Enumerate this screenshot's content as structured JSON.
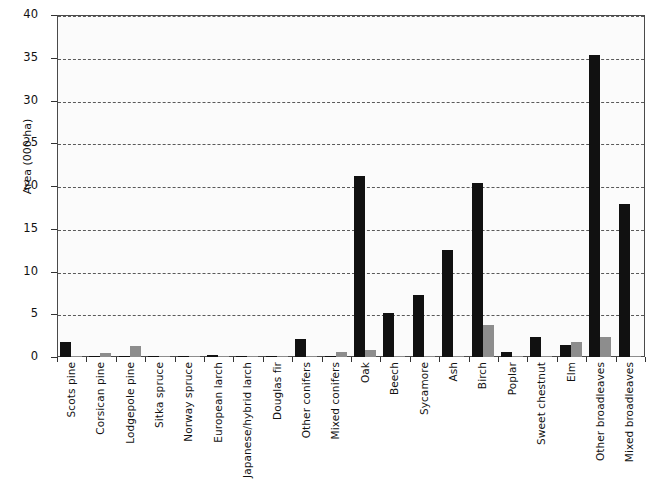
{
  "chart_data": {
    "type": "bar",
    "title": "",
    "xlabel": "",
    "ylabel": "Area (000 ha)",
    "ylim": [
      0,
      40
    ],
    "yticks": [
      0,
      5,
      10,
      15,
      20,
      25,
      30,
      35,
      40
    ],
    "grid": true,
    "legend": "none",
    "categories": [
      "Scots pine",
      "Corsican pine",
      "Lodgepole pine",
      "Sitka spruce",
      "Norway spruce",
      "European larch",
      "Japanese/hybrid larch",
      "Douglas fir",
      "Other conifers",
      "Mixed conifers",
      "Oak",
      "Beech",
      "Sycamore",
      "Ash",
      "Birch",
      "Poplar",
      "Sweet chestnut",
      "Elm",
      "Other broadleaves",
      "Mixed broadleaves"
    ],
    "series": [
      {
        "name": "series-dark",
        "color": "#111111",
        "values": [
          1.7,
          0.05,
          0.05,
          0.05,
          0.05,
          0.2,
          0.05,
          0.05,
          2.1,
          0.1,
          21.2,
          5.2,
          7.3,
          12.5,
          20.4,
          0.6,
          2.3,
          1.4,
          35.3,
          17.9
        ]
      },
      {
        "name": "series-light",
        "color": "#8d8d8d",
        "values": [
          0.05,
          0.5,
          1.3,
          0.05,
          0.05,
          0.05,
          0.05,
          0.05,
          0.05,
          0.6,
          0.8,
          0.05,
          0.05,
          0.05,
          3.7,
          0.05,
          0.05,
          1.8,
          2.3,
          0.05
        ]
      }
    ]
  },
  "axis": {
    "y_tick_labels": [
      "0",
      "5",
      "10",
      "15",
      "20",
      "25",
      "30",
      "35",
      "40"
    ],
    "y_title": "Area (000 ha)"
  }
}
